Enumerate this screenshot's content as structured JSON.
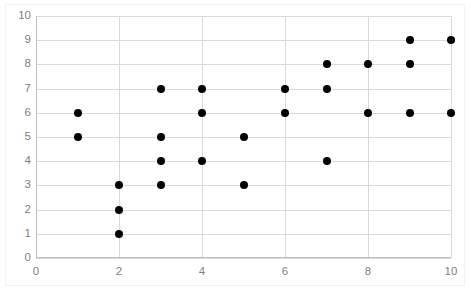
{
  "chart_data": {
    "type": "scatter",
    "title": "",
    "xlabel": "",
    "ylabel": "",
    "xlim": [
      0,
      10
    ],
    "ylim": [
      0,
      10
    ],
    "grid": true,
    "legend": "none",
    "marker": "filled-circle",
    "marker_color": "#000000",
    "gridline_color": "#D9D9D9",
    "tick_label_color": "#808080",
    "x_ticks": [
      0,
      2,
      4,
      6,
      8,
      10
    ],
    "y_ticks": [
      0,
      1,
      2,
      3,
      4,
      5,
      6,
      7,
      8,
      9,
      10
    ],
    "x_minor_step": 1,
    "y_minor_step": 1,
    "points": [
      {
        "x": 1,
        "y": 6
      },
      {
        "x": 1,
        "y": 5
      },
      {
        "x": 2,
        "y": 3
      },
      {
        "x": 2,
        "y": 2
      },
      {
        "x": 2,
        "y": 1
      },
      {
        "x": 3,
        "y": 7
      },
      {
        "x": 3,
        "y": 5
      },
      {
        "x": 3,
        "y": 4
      },
      {
        "x": 3,
        "y": 3
      },
      {
        "x": 4,
        "y": 7
      },
      {
        "x": 4,
        "y": 6
      },
      {
        "x": 4,
        "y": 4
      },
      {
        "x": 5,
        "y": 5
      },
      {
        "x": 5,
        "y": 3
      },
      {
        "x": 6,
        "y": 7
      },
      {
        "x": 6,
        "y": 6
      },
      {
        "x": 7,
        "y": 8
      },
      {
        "x": 7,
        "y": 7
      },
      {
        "x": 7,
        "y": 4
      },
      {
        "x": 8,
        "y": 8
      },
      {
        "x": 8,
        "y": 6
      },
      {
        "x": 9,
        "y": 9
      },
      {
        "x": 9,
        "y": 8
      },
      {
        "x": 9,
        "y": 6
      },
      {
        "x": 10,
        "y": 9
      },
      {
        "x": 10,
        "y": 6
      }
    ]
  }
}
